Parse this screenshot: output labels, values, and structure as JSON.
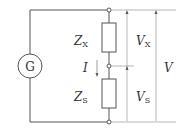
{
  "diagram": {
    "type": "circuit",
    "source": {
      "label": "G"
    },
    "components": [
      {
        "id": "zx",
        "symbol": "Z",
        "subscript": "X"
      },
      {
        "id": "zs",
        "symbol": "Z",
        "subscript": "S"
      }
    ],
    "current": {
      "label": "I"
    },
    "voltages": [
      {
        "id": "vx",
        "symbol": "V",
        "subscript": "X"
      },
      {
        "id": "vs",
        "symbol": "V",
        "subscript": "S"
      },
      {
        "id": "v",
        "symbol": "V",
        "subscript": ""
      }
    ],
    "colors": {
      "wire": "#555555",
      "dimension": "#888888",
      "text": "#333333"
    }
  }
}
